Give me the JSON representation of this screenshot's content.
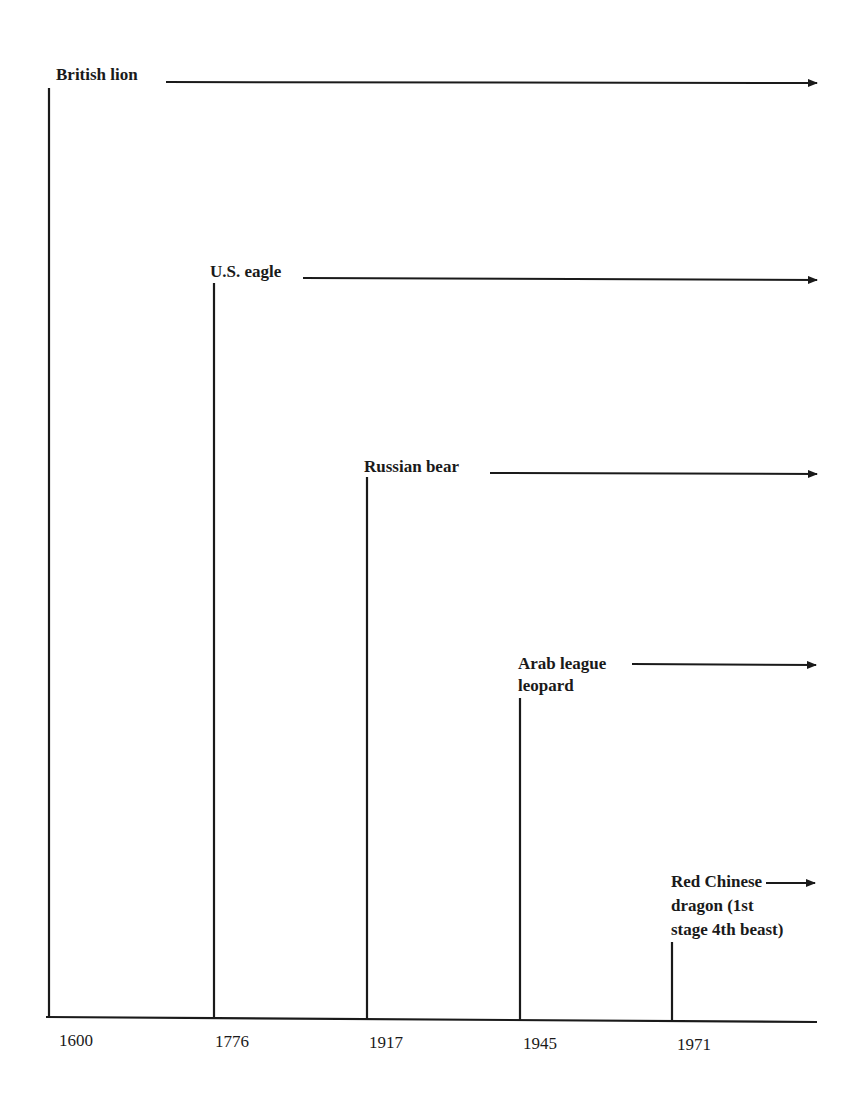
{
  "diagram": {
    "type": "timeline",
    "colors": {
      "ink": "#1a1a1a",
      "background": "#ffffff"
    },
    "axis": {
      "ticks": [
        {
          "label": "1600",
          "x": 58
        },
        {
          "label": "1776",
          "x": 214
        },
        {
          "label": "1917",
          "x": 369
        },
        {
          "label": "1945",
          "x": 523
        },
        {
          "label": "1971",
          "x": 677
        }
      ]
    },
    "powers": [
      {
        "id": "british-lion",
        "label_lines": [
          "British lion"
        ],
        "year": "1600",
        "arrow_icon": "right-arrow"
      },
      {
        "id": "us-eagle",
        "label_lines": [
          "U.S. eagle"
        ],
        "year": "1776",
        "arrow_icon": "right-arrow"
      },
      {
        "id": "russian-bear",
        "label_lines": [
          "Russian bear"
        ],
        "year": "1917",
        "arrow_icon": "right-arrow"
      },
      {
        "id": "arab-league-leopard",
        "label_lines": [
          "Arab league",
          "leopard"
        ],
        "year": "1945",
        "arrow_icon": "right-arrow"
      },
      {
        "id": "red-chinese-dragon",
        "label_lines": [
          "Red Chinese",
          "dragon (1st",
          "stage 4th beast)"
        ],
        "year": "1971",
        "arrow_icon": "right-arrow"
      }
    ]
  }
}
